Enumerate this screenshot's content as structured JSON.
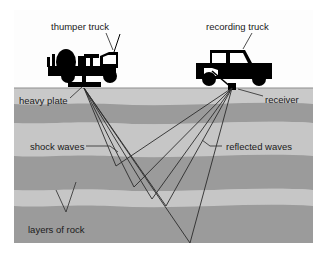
{
  "figure": {
    "width": 324,
    "height": 259
  },
  "colors": {
    "page_background": "#ffffff",
    "panel_background": "#f2f2f2",
    "panel_border": "#ffffff",
    "sky_band": "#fbfbfb",
    "ground_light": "#c3c3c3",
    "ground_dark": "#9a9a9a",
    "ground_mid": "#b0b0b0",
    "vehicle_fill": "#000000",
    "ray_line": "#2a2a2a",
    "leader_line": "#3a3a3a",
    "label_text": "#1a1a1a"
  },
  "labels": {
    "thumper_truck": "thumper truck",
    "recording_truck": "recording truck",
    "heavy_plate": "heavy plate",
    "receiver": "receiver",
    "shock_waves": "shock waves",
    "reflected_waves": "reflected waves",
    "layers_of_rock": "layers of rock"
  },
  "diagram_elements": {
    "source_plate": {
      "name": "heavy plate",
      "x": 84,
      "y": 87
    },
    "receiver_box": {
      "name": "receiver",
      "x": 232,
      "y": 88
    },
    "ground_surface_y": 88,
    "rock_layer_count": 7,
    "shock_ray_count": 5,
    "reflected_ray_count": 5
  }
}
